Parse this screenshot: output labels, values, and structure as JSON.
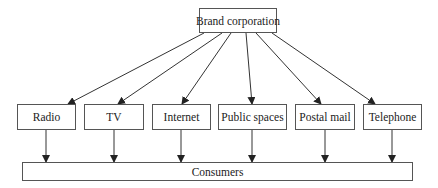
{
  "diagram": {
    "source": {
      "id": "brand",
      "label": "Brand corporation"
    },
    "channels": [
      {
        "id": "radio",
        "label": "Radio"
      },
      {
        "id": "tv",
        "label": "TV"
      },
      {
        "id": "internet",
        "label": "Internet"
      },
      {
        "id": "public-spaces",
        "label": "Public spaces"
      },
      {
        "id": "postal-mail",
        "label": "Postal mail"
      },
      {
        "id": "telephone",
        "label": "Telephone"
      }
    ],
    "target": {
      "id": "consumers",
      "label": "Consumers"
    },
    "edges": [
      {
        "from": "brand",
        "to": "radio"
      },
      {
        "from": "brand",
        "to": "tv"
      },
      {
        "from": "brand",
        "to": "internet"
      },
      {
        "from": "brand",
        "to": "public-spaces"
      },
      {
        "from": "brand",
        "to": "postal-mail"
      },
      {
        "from": "brand",
        "to": "telephone"
      },
      {
        "from": "radio",
        "to": "consumers"
      },
      {
        "from": "tv",
        "to": "consumers"
      },
      {
        "from": "internet",
        "to": "consumers"
      },
      {
        "from": "public-spaces",
        "to": "consumers"
      },
      {
        "from": "postal-mail",
        "to": "consumers"
      },
      {
        "from": "telephone",
        "to": "consumers"
      }
    ],
    "colors": {
      "line": "#333333",
      "border": "#555555",
      "text": "#222222"
    }
  }
}
